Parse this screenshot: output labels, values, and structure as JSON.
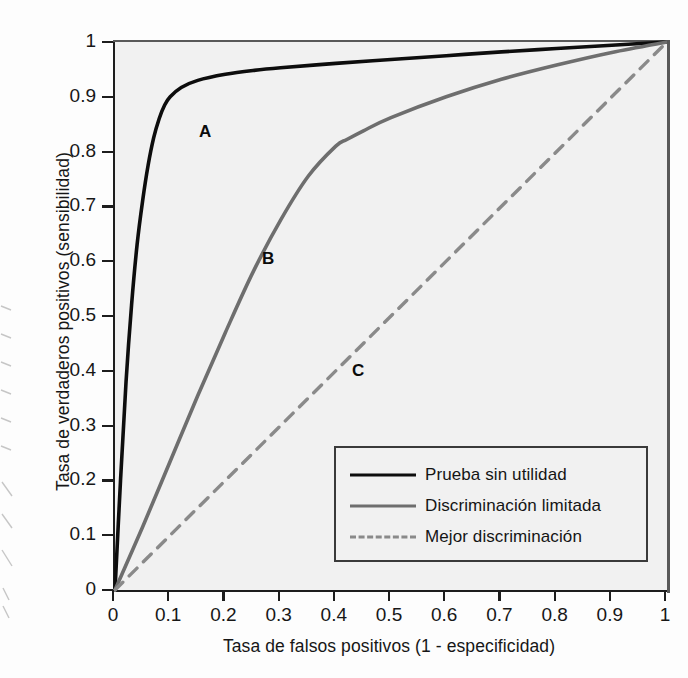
{
  "chart_data": {
    "type": "line",
    "title": "",
    "xlabel": "Tasa de falsos positivos (1 - especificidad)",
    "ylabel": "Tasa de verdaderos positivos (sensibilidad)",
    "xlim": [
      0,
      1
    ],
    "ylim": [
      0,
      1
    ],
    "grid": false,
    "legend_position": "lower right",
    "xticks": [
      "0",
      "0.1",
      "0.2",
      "0.3",
      "0.4",
      "0.5",
      "0.6",
      "0.7",
      "0.8",
      "0.9",
      "1"
    ],
    "yticks": [
      "0",
      "0.1",
      "0.2",
      "0.3",
      "0.4",
      "0.5",
      "0.6",
      "0.7",
      "0.8",
      "0.9",
      "1"
    ],
    "xtick_values": [
      0,
      0.1,
      0.2,
      0.3,
      0.4,
      0.5,
      0.6,
      0.7,
      0.8,
      0.9,
      1
    ],
    "ytick_values": [
      0,
      0.1,
      0.2,
      0.3,
      0.4,
      0.5,
      0.6,
      0.7,
      0.8,
      0.9,
      1
    ],
    "series": [
      {
        "name": "Prueba sin utilidad",
        "annotation": "A",
        "color": "#0d0d0d",
        "style": "solid",
        "x": [
          0,
          0.01,
          0.02,
          0.03,
          0.04,
          0.05,
          0.06,
          0.07,
          0.08,
          0.09,
          0.1,
          0.12,
          0.15,
          0.2,
          0.25,
          0.3,
          0.4,
          0.5,
          0.6,
          0.7,
          0.8,
          0.9,
          1
        ],
        "y": [
          0,
          0.2,
          0.38,
          0.52,
          0.63,
          0.71,
          0.775,
          0.825,
          0.86,
          0.885,
          0.9,
          0.917,
          0.93,
          0.941,
          0.948,
          0.953,
          0.961,
          0.968,
          0.975,
          0.982,
          0.988,
          0.994,
          1
        ]
      },
      {
        "name": "Discriminación limitada",
        "annotation": "B",
        "color": "#6e6e6e",
        "style": "solid",
        "x": [
          0,
          0.05,
          0.1,
          0.15,
          0.2,
          0.25,
          0.3,
          0.35,
          0.4,
          0.42,
          0.45,
          0.5,
          0.6,
          0.7,
          0.8,
          0.9,
          1
        ],
        "y": [
          0,
          0.115,
          0.235,
          0.355,
          0.47,
          0.58,
          0.675,
          0.755,
          0.81,
          0.822,
          0.838,
          0.862,
          0.9,
          0.932,
          0.958,
          0.981,
          1
        ]
      },
      {
        "name": "Mejor discriminación",
        "annotation": "C",
        "color": "#8a8a8a",
        "style": "dashed",
        "x": [
          0,
          1
        ],
        "y": [
          0,
          1
        ]
      }
    ],
    "annotations": [
      {
        "label": "A",
        "x": 0.167,
        "y": 0.834
      },
      {
        "label": "B",
        "x": 0.281,
        "y": 0.603
      },
      {
        "label": "C",
        "x": 0.444,
        "y": 0.398
      }
    ]
  },
  "legend": {
    "entries": [
      {
        "label": "Prueba sin utilidad",
        "swatch": "solid-black"
      },
      {
        "label": "Discriminación limitada",
        "swatch": "solid-gray"
      },
      {
        "label": "Mejor discriminación",
        "swatch": "dashed-gray"
      }
    ]
  }
}
